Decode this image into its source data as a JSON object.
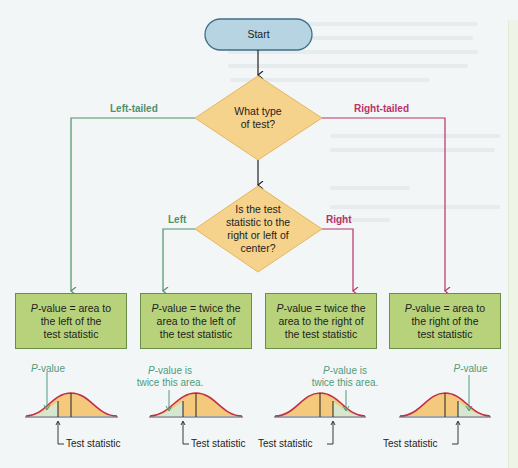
{
  "flowchart": {
    "start": {
      "label": "Start",
      "fill": "#b6d4e2",
      "stroke": "#3e6f8a"
    },
    "decision1": {
      "lines": [
        "What type",
        "of test?"
      ],
      "fill": "#f5d38c",
      "stroke": "#e6b660"
    },
    "decision2": {
      "lines": [
        "Is the test",
        "statistic to the",
        "right or left of",
        "center?"
      ],
      "fill": "#f5d38c",
      "stroke": "#e6b660"
    },
    "branches": {
      "left_tailed": "Left-tailed",
      "right_tailed": "Right-tailed",
      "left": "Left",
      "right": "Right"
    },
    "colors": {
      "left_branch": "#4f9068",
      "right_branch": "#b8336a",
      "box_fill": "#b7d27a",
      "curve": "#c0304a",
      "curve_fill": "#f4c97c",
      "tail_fill": "#d7e6cf"
    },
    "results": [
      {
        "italic": "P",
        "lines": [
          "-value = area to",
          "the left of the",
          "test statistic"
        ]
      },
      {
        "italic": "P",
        "lines": [
          "-value = twice the",
          "area to the left of",
          "the test statistic"
        ]
      },
      {
        "italic": "P",
        "lines": [
          "-value = twice the",
          "area to the right of",
          "the test statistic"
        ]
      },
      {
        "italic": "P",
        "lines": [
          "-value = area to",
          "the right of the",
          "test statistic"
        ]
      }
    ],
    "curves": [
      {
        "annotation_italic": "P",
        "annotation": [
          "-value"
        ],
        "test_label": "Test statistic",
        "tail": "left"
      },
      {
        "annotation_italic": "P",
        "annotation": [
          "-value is",
          "twice this area."
        ],
        "test_label": "Test statistic",
        "tail": "left"
      },
      {
        "annotation_italic": "P",
        "annotation": [
          "-value is",
          "twice this area."
        ],
        "test_label": "Test statistic",
        "tail": "right"
      },
      {
        "annotation_italic": "P",
        "annotation": [
          "-value"
        ],
        "test_label": "Test statistic",
        "tail": "right"
      }
    ]
  }
}
